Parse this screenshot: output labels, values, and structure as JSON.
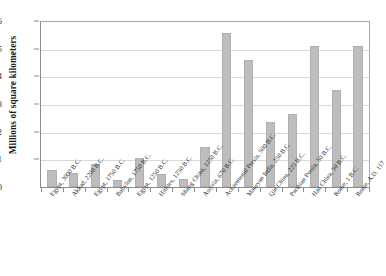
{
  "chart_data": {
    "type": "bar",
    "title": "",
    "xlabel": "",
    "ylabel": "Millions of square kilometers",
    "ylim": [
      0,
      6
    ],
    "yticks": [
      0,
      1,
      2,
      3,
      4,
      5,
      6
    ],
    "ytick_labels": [
      "0",
      "1",
      "2",
      "3",
      "4",
      "5",
      "6"
    ],
    "grid": true,
    "legend": null,
    "bar_color": "#bdbdbd",
    "categories": [
      "Egypt, 3000 B.C.",
      "Akkad, 2200 B.C.",
      "Egypt, 1750 B.C.",
      "Babylon, 1750 B.C.",
      "Egypt, 1250 B.C.",
      "Hittites, 1250 B.C.",
      "Shang China, 1250 B.C.",
      "Assyria, 670 B.C.",
      "Achaemenid Persia, 500 B.C.",
      "Mauryan India, 250 B.C.",
      "Qin China, 225 B.C.",
      "Parthian Persia, 50 B.C.",
      "Han China, 50 B.C.",
      "Rome, 1 B.C.",
      "Rome, A.D. 117"
    ],
    "values": [
      0.6,
      0.5,
      0.82,
      0.26,
      1.05,
      0.48,
      0.28,
      1.45,
      5.55,
      4.58,
      2.35,
      2.65,
      5.1,
      3.52,
      5.1
    ]
  }
}
